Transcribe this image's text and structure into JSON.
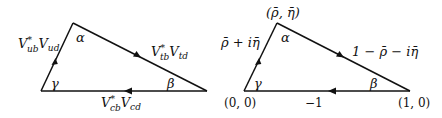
{
  "diagram": {
    "type": "unitarity-triangles",
    "left_triangle": {
      "edges": {
        "left": {
          "label_main": "V",
          "label_sup": "*",
          "label_sub1": "ub",
          "label_main2": "V",
          "label_sub2": "ud",
          "direction": "up"
        },
        "top": {
          "label_main": "V",
          "label_sup": "*",
          "label_sub1": "tb",
          "label_main2": "V",
          "label_sub2": "td",
          "direction": "down-right"
        },
        "bottom": {
          "label_main": "V",
          "label_sup": "*",
          "label_sub1": "cb",
          "label_main2": "V",
          "label_sub2": "cd",
          "direction": "left"
        }
      },
      "angles": {
        "apex": "α",
        "bottom_left": "γ",
        "bottom_right": "β"
      }
    },
    "right_triangle": {
      "vertices": {
        "apex": "(ρ̄, η̄)",
        "bottom_left": "(0, 0)",
        "bottom_right": "(1, 0)"
      },
      "edges": {
        "left": {
          "label": "ρ̄ + iη̄",
          "direction": "up"
        },
        "top": {
          "label": "1 − ρ̄ − iη̄",
          "direction": "down-right"
        },
        "bottom": {
          "label": "−1",
          "direction": "left"
        }
      },
      "angles": {
        "apex": "α",
        "bottom_left": "γ",
        "bottom_right": "β"
      }
    }
  }
}
